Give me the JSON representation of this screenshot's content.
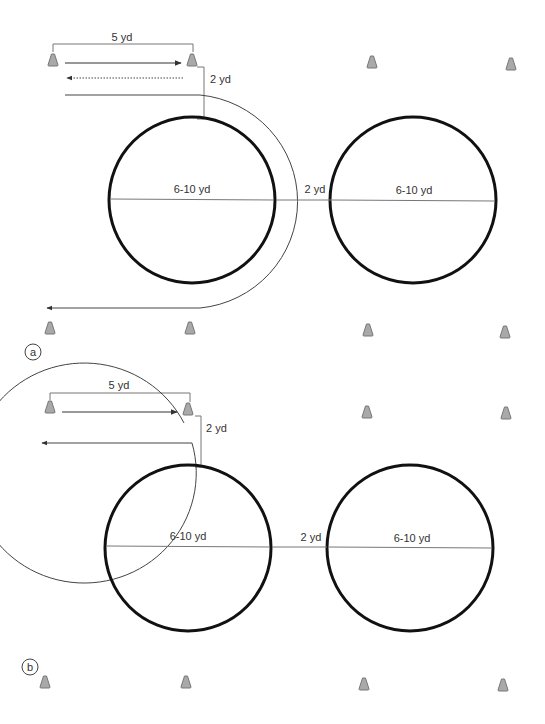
{
  "figure": {
    "type": "drill-diagram",
    "colors": {
      "hoop": "#111111",
      "path": "#444444",
      "dimension": "#777777",
      "cone_fill": "#a9a9a9",
      "cone_stroke": "#777777",
      "text": "#333333"
    },
    "panels": [
      {
        "id": "a",
        "label": "a",
        "cone_spacing_label": "5 yd",
        "offset_label": "2 yd",
        "hoop1_label": "6-10 yd",
        "gap_label": "2 yd",
        "hoop2_label": "6-10 yd",
        "cones": 8,
        "paths": [
          "solid-forward-arrow",
          "dotted-return-arrow",
          "solid-curve-around-hoop-1-with-arrow"
        ]
      },
      {
        "id": "b",
        "label": "b",
        "cone_spacing_label": "5 yd",
        "offset_label": "2 yd",
        "hoop1_label": "6-10 yd",
        "gap_label": "2 yd",
        "hoop2_label": "6-10 yd",
        "cones": 8,
        "paths": [
          "solid-forward-arrow",
          "full-loop-around-hoop-1-with-arrow"
        ]
      }
    ]
  }
}
